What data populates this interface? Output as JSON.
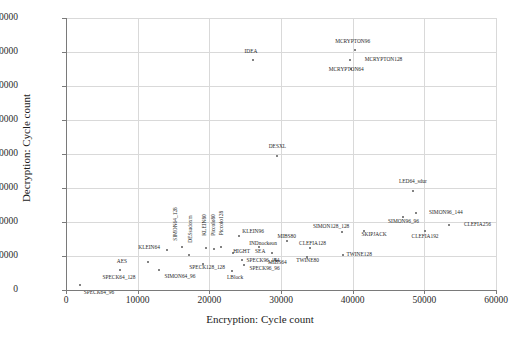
{
  "chart_data": {
    "type": "scatter",
    "title": "",
    "xlabel": "Encryption: Cycle count",
    "ylabel": "Decryption: Cycle count",
    "xlim": [
      0,
      60000
    ],
    "ylim": [
      0,
      160000
    ],
    "xticks": [
      0,
      10000,
      20000,
      30000,
      40000,
      50000,
      60000
    ],
    "yticks": [
      0,
      20000,
      40000,
      60000,
      80000,
      100000,
      120000,
      140000,
      160000
    ],
    "xtick_labels": [
      "0",
      "10000",
      "20000",
      "30000",
      "40000",
      "50000",
      "60000"
    ],
    "ytick_labels": [
      "0",
      "20000",
      "40000",
      "60000",
      "80000",
      "100000",
      "120000",
      "140000",
      "160000"
    ],
    "grid": true,
    "legend": "none",
    "marker_color": "#5a5a5a",
    "grid_color": "#d9d9d9",
    "axis_color": "#7a7a7a",
    "points": [
      {
        "label": "SPECK64_96",
        "x": 1900,
        "y": 3000,
        "lx": 2700,
        "ly": -4700,
        "rot": false
      },
      {
        "label": "SPECK64_128",
        "x": 7600,
        "y": 11500,
        "lx": -200,
        "ly": -4300,
        "rot": false
      },
      {
        "label": "AES",
        "x": 11500,
        "y": 16500,
        "lx": -3700,
        "ly": -300,
        "rot": false
      },
      {
        "label": "SIMON64_96",
        "x": 13000,
        "y": 12000,
        "lx": 2900,
        "ly": -4200,
        "rot": false
      },
      {
        "label": "KLEIN64",
        "x": 14100,
        "y": 23500,
        "lx": -2500,
        "ly": 1000,
        "rot": false
      },
      {
        "label": "SIMON64_128",
        "x": 16200,
        "y": 25500,
        "lx": -900,
        "ly": 13500,
        "rot": true
      },
      {
        "label": "DESsudoxm",
        "x": 17200,
        "y": 20500,
        "lx": 200,
        "ly": 15500,
        "rot": true
      },
      {
        "label": "KLEIN80",
        "x": 19600,
        "y": 24500,
        "lx": -200,
        "ly": 13500,
        "rot": true
      },
      {
        "label": "Piccolo80",
        "x": 20600,
        "y": 24000,
        "lx": 100,
        "ly": 14500,
        "rot": true
      },
      {
        "label": "Piccolo128",
        "x": 21600,
        "y": 25500,
        "lx": 100,
        "ly": 14000,
        "rot": true
      },
      {
        "label": "KLEIN96",
        "x": 24100,
        "y": 31500,
        "lx": 2000,
        "ly": 2500,
        "rot": false
      },
      {
        "label": "HIGHT",
        "x": 23300,
        "y": 21500,
        "lx": 1200,
        "ly": 900,
        "rot": false
      },
      {
        "label": "SPECK128_128",
        "x": 19100,
        "y": 15500,
        "lx": 600,
        "ly": -2700,
        "rot": false
      },
      {
        "label": "SPECK96_144",
        "x": 24600,
        "y": 17500,
        "lx": 2900,
        "ly": -600,
        "rot": false
      },
      {
        "label": "SPECK96_96",
        "x": 24800,
        "y": 14800,
        "lx": 2900,
        "ly": -2600,
        "rot": false
      },
      {
        "label": "LBlock",
        "x": 23100,
        "y": 11000,
        "lx": 500,
        "ly": -3700,
        "rot": false
      },
      {
        "label": "SEA",
        "x": 28800,
        "y": 21500,
        "lx": -1700,
        "ly": 1100,
        "rot": false
      },
      {
        "label": "MIBS64",
        "x": 29100,
        "y": 18500,
        "lx": 400,
        "ly": -2400,
        "rot": false
      },
      {
        "label": "MIBS80",
        "x": 30800,
        "y": 29000,
        "lx": 0,
        "ly": 2300,
        "rot": false
      },
      {
        "label": "INDnockeon",
        "x": 26900,
        "y": 25500,
        "lx": 600,
        "ly": 1700,
        "rot": false
      },
      {
        "label": "CLEFIA128",
        "x": 34100,
        "y": 24500,
        "lx": 300,
        "ly": 2400,
        "rot": false
      },
      {
        "label": "TWINE80",
        "x": 33600,
        "y": 19500,
        "lx": 100,
        "ly": -2200,
        "rot": false
      },
      {
        "label": "TWINE128",
        "x": 38600,
        "y": 20500,
        "lx": 2300,
        "ly": 0,
        "rot": false
      },
      {
        "label": "SIMON128_128",
        "x": 38500,
        "y": 34000,
        "lx": -1500,
        "ly": 2900,
        "rot": false
      },
      {
        "label": "SKIPJACK",
        "x": 41600,
        "y": 34500,
        "lx": 1400,
        "ly": -2400,
        "rot": false
      },
      {
        "label": "DESXL",
        "x": 29500,
        "y": 79000,
        "lx": 0,
        "ly": 4900,
        "rot": false
      },
      {
        "label": "IDEA",
        "x": 26100,
        "y": 135500,
        "lx": -300,
        "ly": 4700,
        "rot": false
      },
      {
        "label": "MCRYPTON96",
        "x": 40300,
        "y": 141000,
        "lx": -300,
        "ly": 4700,
        "rot": false
      },
      {
        "label": "MCRYPTON128",
        "x": 39600,
        "y": 135500,
        "lx": 4700,
        "ly": 0,
        "rot": false
      },
      {
        "label": "MCRYPTON64",
        "x": 39800,
        "y": 130000,
        "lx": -700,
        "ly": -300,
        "rot": false
      },
      {
        "label": "LED64_sdur",
        "x": 48400,
        "y": 58500,
        "lx": 0,
        "ly": 4800,
        "rot": false
      },
      {
        "label": "SIMON96_144",
        "x": 48800,
        "y": 45500,
        "lx": 4200,
        "ly": 0,
        "rot": false
      },
      {
        "label": "SIMON96_96",
        "x": 47000,
        "y": 43000,
        "lx": 100,
        "ly": -2800,
        "rot": false
      },
      {
        "label": "CLEFIA256",
        "x": 53400,
        "y": 38500,
        "lx": 4000,
        "ly": 0,
        "rot": false
      },
      {
        "label": "CLEFIA192",
        "x": 50100,
        "y": 34500,
        "lx": 0,
        "ly": -3500,
        "rot": false
      }
    ]
  }
}
